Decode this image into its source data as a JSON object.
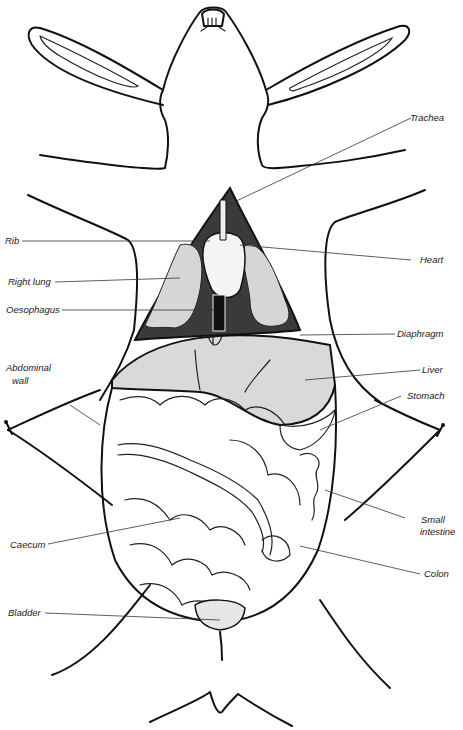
{
  "diagram": {
    "labels": {
      "trachea": "Trachea",
      "rib": "Rib",
      "heart": "Heart",
      "right_lung": "Right lung",
      "oesophagus": "Oesophagus",
      "diaphragm": "Diaphragm",
      "abdominal_wall_1": "Abdominal",
      "abdominal_wall_2": "wall",
      "liver": "Liver",
      "stomach": "Stomach",
      "small_intestine_1": "Small",
      "small_intestine_2": "intestine",
      "caecum": "Caecum",
      "colon": "Colon",
      "bladder": "Bladder"
    },
    "colors": {
      "line": "#111111",
      "thorax_cavity": "#3a3a3a",
      "lung": "#d6d6d6",
      "liver": "#d9d9d9",
      "background": "#ffffff"
    }
  }
}
